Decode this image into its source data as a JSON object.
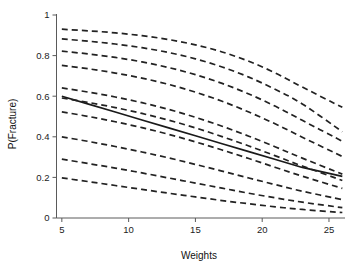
{
  "chart_data": {
    "type": "line",
    "title": "",
    "xlabel": "Weights",
    "ylabel": "P(Fracture)",
    "xlim": [
      4.6,
      26.2
    ],
    "ylim": [
      0,
      1
    ],
    "xticks": [
      5,
      10,
      15,
      20,
      25
    ],
    "xtick_labels": [
      "5",
      "10",
      "15",
      "20",
      "25"
    ],
    "yticks": [
      0,
      0.2,
      0.4,
      0.6,
      0.8,
      1
    ],
    "ytick_labels": [
      "0",
      "0.2",
      "0.4",
      "0.6",
      "0.8",
      "1"
    ],
    "grid": false,
    "legend": null,
    "x": [
      5,
      7,
      9,
      11,
      13,
      15,
      17,
      19,
      21,
      23,
      26
    ],
    "series": [
      {
        "name": "fitted-logistic-population",
        "style": "solid",
        "color": "#1a1a1a",
        "values": [
          0.6,
          0.561,
          0.522,
          0.483,
          0.444,
          0.405,
          0.366,
          0.327,
          0.288,
          0.249,
          0.205
        ]
      },
      {
        "name": "subject-curve-1",
        "style": "dashed",
        "color": "#222222",
        "values": [
          0.93,
          0.922,
          0.912,
          0.898,
          0.879,
          0.853,
          0.818,
          0.772,
          0.714,
          0.645,
          0.545
        ]
      },
      {
        "name": "subject-curve-2",
        "style": "dashed",
        "color": "#222222",
        "values": [
          0.882,
          0.871,
          0.857,
          0.839,
          0.815,
          0.784,
          0.744,
          0.694,
          0.633,
          0.562,
          0.425
        ]
      },
      {
        "name": "subject-curve-3",
        "style": "dashed",
        "color": "#222222",
        "values": [
          0.822,
          0.808,
          0.791,
          0.769,
          0.741,
          0.706,
          0.663,
          0.611,
          0.55,
          0.481,
          0.378
        ]
      },
      {
        "name": "subject-curve-4",
        "style": "dashed",
        "color": "#222222",
        "values": [
          0.752,
          0.735,
          0.714,
          0.689,
          0.658,
          0.62,
          0.575,
          0.522,
          0.463,
          0.398,
          0.303
        ]
      },
      {
        "name": "subject-curve-5",
        "style": "dashed",
        "color": "#222222",
        "values": [
          0.641,
          0.62,
          0.596,
          0.568,
          0.535,
          0.496,
          0.452,
          0.403,
          0.35,
          0.295,
          0.216
        ]
      },
      {
        "name": "subject-curve-6",
        "style": "dashed",
        "color": "#222222",
        "values": [
          0.591,
          0.569,
          0.544,
          0.515,
          0.482,
          0.444,
          0.401,
          0.355,
          0.306,
          0.256,
          0.185
        ]
      },
      {
        "name": "subject-curve-7",
        "style": "dashed",
        "color": "#222222",
        "values": [
          0.523,
          0.5,
          0.474,
          0.445,
          0.412,
          0.375,
          0.335,
          0.293,
          0.249,
          0.206,
          0.146
        ]
      },
      {
        "name": "subject-curve-8",
        "style": "dashed",
        "color": "#222222",
        "values": [
          0.4,
          0.377,
          0.352,
          0.325,
          0.296,
          0.264,
          0.231,
          0.197,
          0.164,
          0.132,
          0.09
        ]
      },
      {
        "name": "subject-curve-9",
        "style": "dashed",
        "color": "#222222",
        "values": [
          0.29,
          0.268,
          0.246,
          0.222,
          0.197,
          0.172,
          0.147,
          0.122,
          0.099,
          0.078,
          0.051
        ]
      },
      {
        "name": "subject-curve-10",
        "style": "dashed",
        "color": "#222222",
        "values": [
          0.198,
          0.179,
          0.16,
          0.141,
          0.122,
          0.104,
          0.086,
          0.07,
          0.055,
          0.042,
          0.027
        ]
      }
    ]
  },
  "figure": {
    "background_color": "#ffffff",
    "axis_color": "#5a5a5a",
    "line_color": "#222222"
  }
}
